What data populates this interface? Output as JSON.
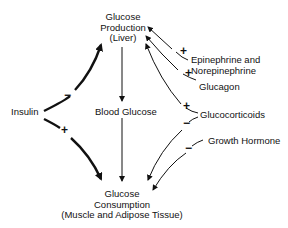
{
  "diagram": {
    "nodes": {
      "production": {
        "line1": "Glucose",
        "line2": "Production",
        "line3": "(Liver)"
      },
      "blood": {
        "label": "Blood Glucose"
      },
      "consumption": {
        "line1": "Glucose",
        "line2": "Consumption",
        "line3": "(Muscle and Adipose Tissue)"
      },
      "insulin": {
        "label": "Insulin"
      },
      "epinephrine": {
        "line1": "Epinephrine and",
        "line2": "Norepinephrine"
      },
      "glucagon": {
        "label": "Glucagon"
      },
      "glucocorticoids": {
        "label": "Glucocorticoids"
      },
      "growth_hormone": {
        "label": "Growth Hormone"
      }
    },
    "signs": {
      "insulin_production": "−",
      "insulin_consumption": "+",
      "epinephrine_production": "+",
      "glucagon_production": "+",
      "glucocorticoids_production": "+",
      "glucocorticoids_consumption": "−",
      "growth_hormone_consumption": "−"
    },
    "edges": [
      {
        "from": "Insulin",
        "to": "Glucose Production (Liver)",
        "sign": "−"
      },
      {
        "from": "Insulin",
        "to": "Glucose Consumption (Muscle and Adipose Tissue)",
        "sign": "+"
      },
      {
        "from": "Glucose Production (Liver)",
        "to": "Blood Glucose",
        "sign": ""
      },
      {
        "from": "Blood Glucose",
        "to": "Glucose Consumption (Muscle and Adipose Tissue)",
        "sign": ""
      },
      {
        "from": "Epinephrine and Norepinephrine",
        "to": "Glucose Production (Liver)",
        "sign": "+"
      },
      {
        "from": "Glucagon",
        "to": "Glucose Production (Liver)",
        "sign": "+"
      },
      {
        "from": "Glucocorticoids",
        "to": "Glucose Production (Liver)",
        "sign": "+"
      },
      {
        "from": "Glucocorticoids",
        "to": "Glucose Consumption (Muscle and Adipose Tissue)",
        "sign": "−"
      },
      {
        "from": "Growth Hormone",
        "to": "Glucose Consumption (Muscle and Adipose Tissue)",
        "sign": "−"
      }
    ]
  }
}
